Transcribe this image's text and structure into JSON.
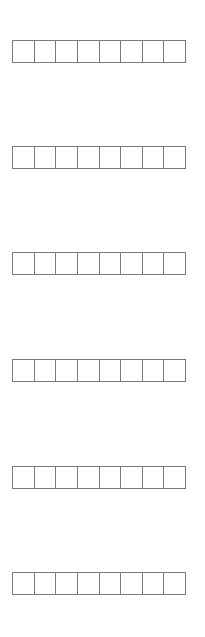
{
  "diagram": {
    "row_count": 6,
    "cells_per_row": 8,
    "border_color": "#7a7a7a",
    "background_color": "#ffffff",
    "rows": [
      {
        "top": 40,
        "cells": [
          "",
          "",
          "",
          "",
          "",
          "",
          "",
          ""
        ]
      },
      {
        "top": 146,
        "cells": [
          "",
          "",
          "",
          "",
          "",
          "",
          "",
          ""
        ]
      },
      {
        "top": 252,
        "cells": [
          "",
          "",
          "",
          "",
          "",
          "",
          "",
          ""
        ]
      },
      {
        "top": 359,
        "cells": [
          "",
          "",
          "",
          "",
          "",
          "",
          "",
          ""
        ]
      },
      {
        "top": 466,
        "cells": [
          "",
          "",
          "",
          "",
          "",
          "",
          "",
          ""
        ]
      },
      {
        "top": 572,
        "cells": [
          "",
          "",
          "",
          "",
          "",
          "",
          "",
          ""
        ]
      }
    ]
  }
}
